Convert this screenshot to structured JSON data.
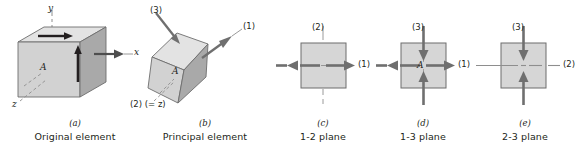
{
  "figure": {
    "background_color": "#ffffff",
    "ink_color": "#231f20",
    "face_light": "#e3e3e3",
    "face_mid": "#d2d2d2",
    "face_dark": "#a9a9a9",
    "square_fill": "#d6d6d6",
    "arrow_color": "#6f6f6f",
    "axis_color": "#8e8e8e"
  },
  "panels": [
    {
      "key": "a",
      "cap_letter": "(a)",
      "cap_text": "Original element",
      "labels": {
        "axis_y": "y",
        "axis_x": "x",
        "axis_z": "z",
        "face": "A"
      }
    },
    {
      "key": "b",
      "cap_letter": "(b)",
      "cap_text": "Principal element",
      "labels": {
        "arrow_3": "(3)",
        "arrow_1": "(1)",
        "axis_2": "(2) (= z)",
        "face": "A"
      }
    },
    {
      "key": "c",
      "cap_letter": "(c)",
      "cap_text": "1-2 plane",
      "labels": {
        "vertical": "(2)",
        "horizontal": "(1)"
      }
    },
    {
      "key": "d",
      "cap_letter": "(d)",
      "cap_text": "1-3 plane",
      "labels": {
        "vertical": "(3)",
        "horizontal": "(1)",
        "face": "A"
      }
    },
    {
      "key": "e",
      "cap_letter": "(e)",
      "cap_text": "2-3 plane",
      "labels": {
        "vertical": "(3)",
        "horizontal": "(2)"
      }
    }
  ],
  "icons": {
    "arrow_out": "arrow-outward-icon",
    "arrow_in": "arrow-inward-icon",
    "axis_dashdot": "dash-dot-axis-icon",
    "leader": "leader-line-icon",
    "cube": "cube-icon",
    "square": "square-icon"
  }
}
